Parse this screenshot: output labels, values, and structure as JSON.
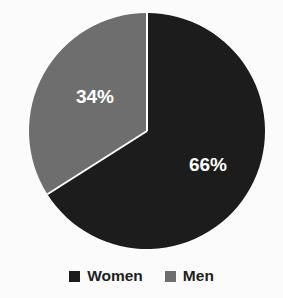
{
  "chart_data": {
    "type": "pie",
    "title": "",
    "labels": [
      "Women",
      "Men"
    ],
    "values": [
      66,
      34
    ],
    "value_labels": [
      "66%",
      "34%"
    ],
    "units": "percent",
    "total": 100,
    "start_angle_deg": 0,
    "direction": "clockwise",
    "colors": [
      "#1c1c1c",
      "#6e6e6e"
    ],
    "legend_position": "bottom",
    "grid": false,
    "slices": [
      {
        "label": "Women",
        "value": 66,
        "value_label": "66%",
        "color": "#1c1c1c",
        "label_x": 208,
        "label_y": 166
      },
      {
        "label": "Men",
        "value": 34,
        "value_label": "34%",
        "color": "#6e6e6e",
        "label_x": 95,
        "label_y": 98
      }
    ]
  },
  "geometry": {
    "center_x": 147,
    "center_y": 131,
    "radius": 118,
    "divider_color": "#ffffff",
    "divider_width": 2
  },
  "background": {
    "color": "#fbfbfb"
  },
  "legend": {
    "items": [
      {
        "label": "Women",
        "color": "#1c1c1c"
      },
      {
        "label": "Men",
        "color": "#6e6e6e"
      }
    ]
  }
}
